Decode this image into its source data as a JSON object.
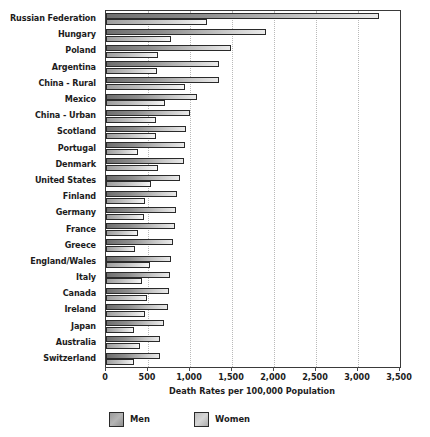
{
  "chart_data": {
    "type": "bar",
    "orientation": "horizontal",
    "title": "",
    "xlabel": "Death Rates per 100,000 Population",
    "ylabel": "",
    "xlim": [
      0,
      3500
    ],
    "xticks": [
      0,
      500,
      1000,
      1500,
      2000,
      2500,
      3000,
      3500
    ],
    "xtick_labels": [
      "0",
      "500",
      "1,000",
      "1,500",
      "2,000",
      "2,500",
      "3,000",
      "3,500"
    ],
    "grid": "vertical-dotted",
    "legend_position": "bottom",
    "categories": [
      "Russian Federation",
      "Hungary",
      "Poland",
      "Argentina",
      "China - Rural",
      "Mexico",
      "China - Urban",
      "Scotland",
      "Portugal",
      "Denmark",
      "United States",
      "Finland",
      "Germany",
      "France",
      "Greece",
      "England/Wales",
      "Italy",
      "Canada",
      "Ireland",
      "Japan",
      "Australia",
      "Switzerland"
    ],
    "series": [
      {
        "name": "Men",
        "color": "#8e8e8e",
        "values": [
          3250,
          1900,
          1490,
          1350,
          1340,
          1080,
          1000,
          955,
          940,
          930,
          880,
          845,
          835,
          820,
          800,
          775,
          765,
          755,
          740,
          690,
          645,
          640
        ]
      },
      {
        "name": "Women",
        "color": "#c9c9c9",
        "values": [
          1200,
          770,
          620,
          610,
          945,
          700,
          595,
          600,
          380,
          620,
          540,
          470,
          455,
          375,
          345,
          520,
          425,
          490,
          465,
          330,
          400,
          335
        ]
      }
    ]
  },
  "legend": {
    "items": [
      {
        "label": "Men",
        "key": "men"
      },
      {
        "label": "Women",
        "key": "women"
      }
    ]
  }
}
